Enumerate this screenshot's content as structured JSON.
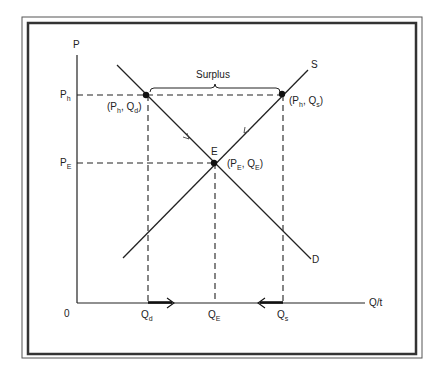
{
  "diagram": {
    "title": "",
    "axes": {
      "y_label": "P",
      "x_label": "Q/t",
      "origin_label": "0"
    },
    "price_ticks": [
      {
        "main": "P",
        "sub": "h"
      },
      {
        "main": "P",
        "sub": "E"
      }
    ],
    "quantity_ticks": [
      {
        "main": "Q",
        "sub": "d"
      },
      {
        "main": "Q",
        "sub": "E"
      },
      {
        "main": "Q",
        "sub": "s"
      }
    ],
    "curves": {
      "supply_label": "S",
      "demand_label": "D"
    },
    "equilibrium": {
      "label": "E",
      "coord_label": {
        "open": "(P",
        "p_sub": "E",
        "mid": ", Q",
        "q_sub": "E",
        "close": ")"
      }
    },
    "points": {
      "ph_qd": {
        "open": "(P",
        "p_sub": "h",
        "mid": ", Q",
        "q_sub": "d",
        "close": ")"
      },
      "ph_qs": {
        "open": "(P",
        "p_sub": "h",
        "mid": ", Q",
        "q_sub": "s",
        "close": ")"
      }
    },
    "bracket_label": "Surplus",
    "colors": {
      "ink": "#222222",
      "frame": "#333333",
      "background": "#ffffff"
    }
  }
}
